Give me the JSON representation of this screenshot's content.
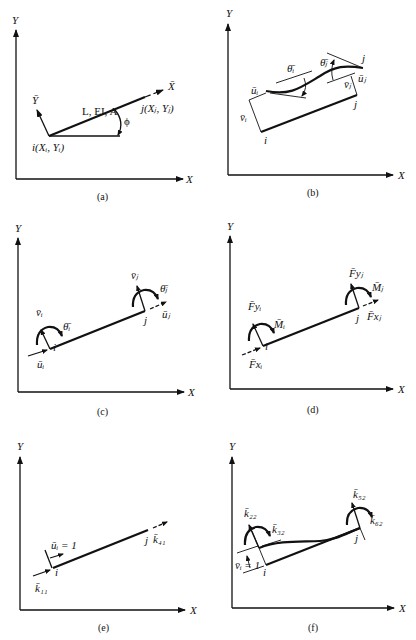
{
  "figure": {
    "panels": [
      {
        "id": "a",
        "caption": "(a)",
        "axis_x": "X",
        "axis_y": "Y",
        "local_x": "X̄",
        "local_y": "Ȳ",
        "member_props": "L, EI, A",
        "node_i": "i(Xᵢ, Yᵢ)",
        "node_j": "j(Xⱼ, Yⱼ)",
        "angle": "ϕ"
      },
      {
        "id": "b",
        "caption": "(b)",
        "axis_x": "X",
        "axis_y": "Y",
        "theta_i": "θ̄ᵢ",
        "theta_j": "θ̄ⱼ",
        "u_i": "ūᵢ",
        "u_j": "ūⱼ",
        "v_i": "v̄ᵢ",
        "v_j": "v̄ⱼ",
        "node_i": "i",
        "node_j": "j",
        "node_j_deformed": "j"
      },
      {
        "id": "c",
        "caption": "(c)",
        "axis_x": "X",
        "axis_y": "Y",
        "v_i": "v̄ᵢ",
        "theta_i": "θ̄ᵢ",
        "u_i": "ūᵢ",
        "v_j": "v̄ⱼ",
        "theta_j": "θ̄ⱼ",
        "u_j": "ūⱼ",
        "node_i": "i",
        "node_j": "j"
      },
      {
        "id": "d",
        "caption": "(d)",
        "axis_x": "X",
        "axis_y": "Y",
        "F_yi": "F̄yᵢ",
        "M_i": "M̄ᵢ",
        "F_xi": "F̄xᵢ",
        "F_yj": "F̄yⱼ",
        "M_j": "M̄ⱼ",
        "F_xj": "F̄xⱼ",
        "node_i": "i",
        "node_j": "j"
      },
      {
        "id": "e",
        "caption": "(e)",
        "axis_x": "X",
        "axis_y": "Y",
        "unit_disp": "ūᵢ = 1",
        "k_11": "k̄₁₁",
        "k_41": "k̄₄₁",
        "node_i": "i",
        "node_j": "j"
      },
      {
        "id": "f",
        "caption": "(f)",
        "axis_x": "X",
        "axis_y": "Y",
        "unit_disp": "v̄ᵢ = 1",
        "k_22": "k̄₂₂",
        "k_32": "k̄₃₂",
        "k_52": "k̄₅₂",
        "k_62": "k̄₆₂",
        "node_i": "i",
        "node_j": "j"
      }
    ]
  }
}
